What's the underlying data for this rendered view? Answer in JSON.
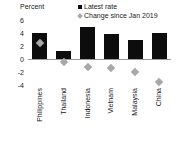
{
  "axis": {
    "y_title": "Percent",
    "ticks": [
      6,
      4,
      2,
      0,
      -2,
      -4
    ]
  },
  "legend": {
    "items": [
      {
        "label": "Latest rate",
        "marker": "square",
        "color": "#0d0d0d"
      },
      {
        "label": "Change since Jan 2019",
        "marker": "diamond",
        "color": "#a8a8a8"
      }
    ]
  },
  "chart_data": {
    "type": "bar",
    "title": "",
    "xlabel": "",
    "ylabel": "Percent",
    "ylim": [
      -4,
      6
    ],
    "yticks": [
      -4,
      -2,
      0,
      2,
      4,
      6
    ],
    "grid": false,
    "zero_line": true,
    "legend_position": "top-right",
    "categories": [
      "Philippines",
      "Thailand",
      "Indonesia",
      "Vietnam",
      "Malaysia",
      "China"
    ],
    "series": [
      {
        "name": "Latest rate",
        "type": "bar",
        "color": "#0d0d0d",
        "values": [
          4.0,
          1.25,
          4.9,
          3.9,
          2.9,
          4.0
        ]
      },
      {
        "name": "Change since Jan 2019",
        "type": "scatter",
        "marker": "diamond",
        "color": "#a8a8a8",
        "values": [
          2.4,
          -0.5,
          -1.25,
          -1.35,
          -2.0,
          -3.5
        ]
      }
    ]
  }
}
